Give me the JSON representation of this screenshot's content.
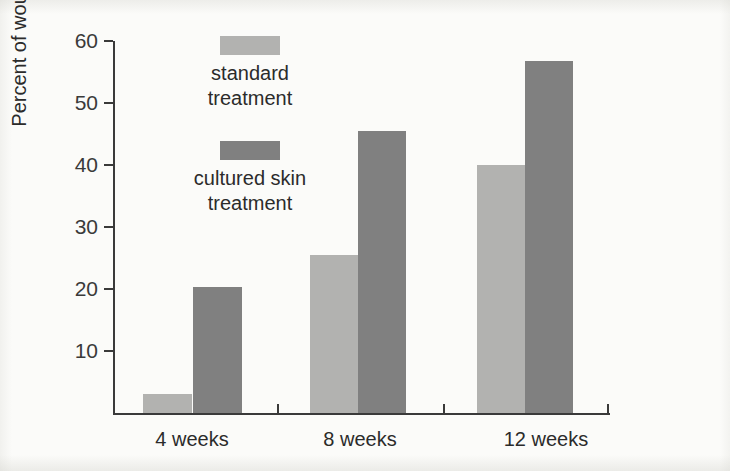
{
  "chart_data": {
    "type": "bar",
    "title": "",
    "subtitle": "",
    "xlabel": "",
    "ylabel": "Percent of wounds healed",
    "categories": [
      "4 weeks",
      "8 weeks",
      "12 weeks"
    ],
    "series": [
      {
        "name": "standard treatment",
        "color": "#b2b2b0",
        "values": [
          3,
          25.5,
          40
        ]
      },
      {
        "name": "cultured skin treatment",
        "color": "#808080",
        "values": [
          20.3,
          45.5,
          56.8
        ]
      }
    ],
    "ylim": [
      0,
      60
    ],
    "yticks": [
      10,
      20,
      30,
      40,
      50,
      60
    ],
    "ytick_labels": [
      "10",
      "20",
      "30",
      "40",
      "50",
      "60"
    ],
    "grid": false,
    "legend_position": "upper-left-inside",
    "axis_color": "#3a3a3a",
    "background_color": "#fbfbf9"
  },
  "axis": {
    "y_title": "Percent of wounds healed",
    "ticks": [
      {
        "label": "60",
        "value": 60
      },
      {
        "label": "50",
        "value": 50
      },
      {
        "label": "40",
        "value": 40
      },
      {
        "label": "30",
        "value": 30
      },
      {
        "label": "20",
        "value": 20
      },
      {
        "label": "10",
        "value": 10
      }
    ],
    "categories": [
      {
        "label": "4 weeks"
      },
      {
        "label": "8 weeks"
      },
      {
        "label": "12 weeks"
      }
    ]
  },
  "legend": {
    "items": [
      {
        "label": "standard\ntreatment",
        "color": "#b2b2b0"
      },
      {
        "label": "cultured skin\ntreatment",
        "color": "#808080"
      }
    ]
  }
}
